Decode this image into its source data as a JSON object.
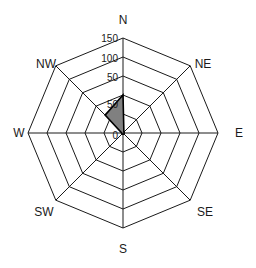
{
  "chart_data": {
    "type": "radar",
    "title": "",
    "subtitle": "",
    "xlabel": "",
    "ylabel": "",
    "categories": [
      "N",
      "NE",
      "E",
      "SE",
      "S",
      "SW",
      "W",
      "NW"
    ],
    "values": [
      60,
      2,
      2,
      2,
      2,
      2,
      2,
      40
    ],
    "series": [
      {
        "name": "",
        "values": [
          60,
          2,
          2,
          2,
          2,
          2,
          2,
          40
        ]
      }
    ],
    "radial_ticks": [
      0,
      50,
      100,
      150
    ],
    "radial_tick_labels": [
      "0",
      "50",
      "100",
      "150"
    ],
    "rings": 5,
    "rlim": [
      0,
      150
    ],
    "grid": true,
    "grid_shape": "polygon",
    "legend": false,
    "legend_position": "none",
    "theta_direction": "clockwise",
    "theta_zero_location": "N",
    "annotations": []
  },
  "axes": {
    "direction_labels": {
      "n": "N",
      "ne": "NE",
      "e": "E",
      "se": "SE",
      "s": "S",
      "sw": "SW",
      "w": "W",
      "nw": "NW"
    },
    "radial_labels": {
      "r0": "0",
      "r1": "50",
      "r2": "100",
      "r3": "150"
    }
  },
  "colors": {
    "grid_line": "#1a1a1a",
    "axis_line": "#1a1a1a",
    "fill": "#808080",
    "fill_stroke": "#000000",
    "background": "#ffffff",
    "text": "#1a1a1a"
  }
}
